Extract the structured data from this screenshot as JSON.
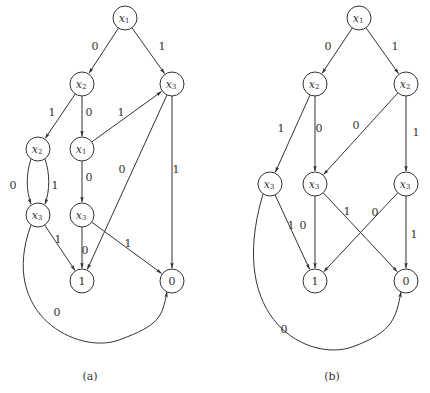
{
  "colors": {
    "stroke": "#333333",
    "background": "#ffffff"
  },
  "graphs": [
    {
      "id": "a",
      "caption": "(a)",
      "caption_pos": [
        90,
        380
      ],
      "nodes": [
        {
          "id": "a_x1",
          "var": "x",
          "sub": "1",
          "x": 125,
          "y": 18
        },
        {
          "id": "a_x2L",
          "var": "x",
          "sub": "2",
          "x": 82,
          "y": 84
        },
        {
          "id": "a_x3R",
          "var": "x",
          "sub": "3",
          "x": 172,
          "y": 84
        },
        {
          "id": "a_x2LL",
          "var": "x",
          "sub": "2",
          "x": 38,
          "y": 149
        },
        {
          "id": "a_x1M",
          "var": "x",
          "sub": "1",
          "x": 82,
          "y": 149
        },
        {
          "id": "a_x3L",
          "var": "x",
          "sub": "3",
          "x": 38,
          "y": 215
        },
        {
          "id": "a_x3M",
          "var": "x",
          "sub": "3",
          "x": 82,
          "y": 215
        },
        {
          "id": "a_T1",
          "terminal": "1",
          "x": 82,
          "y": 281
        },
        {
          "id": "a_T0",
          "terminal": "0",
          "x": 172,
          "y": 281
        }
      ],
      "edges": [
        {
          "from": "a_x1",
          "to": "a_x2L",
          "label": "0",
          "lx": 95,
          "ly": 47
        },
        {
          "from": "a_x1",
          "to": "a_x3R",
          "label": "1",
          "lx": 162,
          "ly": 47
        },
        {
          "from": "a_x2L",
          "to": "a_x2LL",
          "label": "1",
          "lx": 52,
          "ly": 113
        },
        {
          "from": "a_x2L",
          "to": "a_x1M",
          "label": "0",
          "lx": 89,
          "ly": 113
        },
        {
          "from": "a_x1M",
          "to": "a_x3R",
          "label": "1",
          "lx": 121,
          "ly": 113
        },
        {
          "from": "a_x2LL",
          "to": "a_x3L",
          "label": "0",
          "lx": 13,
          "ly": 186,
          "curve": "left"
        },
        {
          "from": "a_x2LL",
          "to": "a_x3L",
          "label": "1",
          "lx": 55,
          "ly": 186,
          "curve": "right"
        },
        {
          "from": "a_x1M",
          "to": "a_x3M",
          "label": "0",
          "lx": 89,
          "ly": 178
        },
        {
          "from": "a_x3R",
          "to": "a_T1",
          "label": "0",
          "lx": 122,
          "ly": 170
        },
        {
          "from": "a_x3R",
          "to": "a_T0",
          "label": "1",
          "lx": 176,
          "ly": 170
        },
        {
          "from": "a_x3L",
          "to": "a_T1",
          "label": "1",
          "lx": 58,
          "ly": 240
        },
        {
          "from": "a_x3M",
          "to": "a_T1",
          "label": "0",
          "lx": 85,
          "ly": 251
        },
        {
          "from": "a_x3M",
          "to": "a_T0",
          "label": "1",
          "lx": 128,
          "ly": 244
        },
        {
          "from": "a_x3L",
          "to": "a_T0",
          "label": "0",
          "lx": 57,
          "ly": 313,
          "curve": "bottom"
        }
      ]
    },
    {
      "id": "b",
      "caption": "(b)",
      "caption_pos": [
        332,
        380
      ],
      "nodes": [
        {
          "id": "b_x1",
          "var": "x",
          "sub": "1",
          "x": 359,
          "y": 18
        },
        {
          "id": "b_x2L",
          "var": "x",
          "sub": "2",
          "x": 315,
          "y": 84
        },
        {
          "id": "b_x2R",
          "var": "x",
          "sub": "2",
          "x": 406,
          "y": 84
        },
        {
          "id": "b_x3L",
          "var": "x",
          "sub": "3",
          "x": 270,
          "y": 184
        },
        {
          "id": "b_x3M",
          "var": "x",
          "sub": "3",
          "x": 315,
          "y": 184
        },
        {
          "id": "b_x3R",
          "var": "x",
          "sub": "3",
          "x": 406,
          "y": 184
        },
        {
          "id": "b_T1",
          "terminal": "1",
          "x": 315,
          "y": 281
        },
        {
          "id": "b_T0",
          "terminal": "0",
          "x": 406,
          "y": 281
        }
      ],
      "edges": [
        {
          "from": "b_x1",
          "to": "b_x2L",
          "label": "0",
          "lx": 328,
          "ly": 47
        },
        {
          "from": "b_x1",
          "to": "b_x2R",
          "label": "1",
          "lx": 395,
          "ly": 47
        },
        {
          "from": "b_x2L",
          "to": "b_x3L",
          "label": "1",
          "lx": 281,
          "ly": 129
        },
        {
          "from": "b_x2L",
          "to": "b_x3M",
          "label": "0",
          "lx": 319,
          "ly": 129
        },
        {
          "from": "b_x2R",
          "to": "b_x3M",
          "label": "0",
          "lx": 356,
          "ly": 126
        },
        {
          "from": "b_x2R",
          "to": "b_x3R",
          "label": "1",
          "lx": 416,
          "ly": 133
        },
        {
          "from": "b_x3L",
          "to": "b_T1",
          "label": "1",
          "lx": 291,
          "ly": 226
        },
        {
          "from": "b_x3M",
          "to": "b_T1",
          "label": "0",
          "lx": 303,
          "ly": 226
        },
        {
          "from": "b_x3M",
          "to": "b_T0",
          "label": "1",
          "lx": 347,
          "ly": 212
        },
        {
          "from": "b_x3R",
          "to": "b_T1",
          "label": "0",
          "lx": 375,
          "ly": 213
        },
        {
          "from": "b_x3R",
          "to": "b_T0",
          "label": "1",
          "lx": 414,
          "ly": 235
        },
        {
          "from": "b_x3L",
          "to": "b_T0",
          "label": "0",
          "lx": 284,
          "ly": 330,
          "curve": "bottom"
        }
      ]
    }
  ]
}
